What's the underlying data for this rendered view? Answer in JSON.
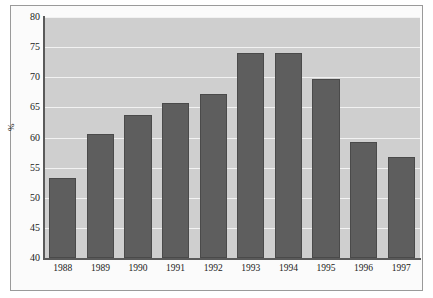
{
  "chart_data": {
    "type": "bar",
    "title": "",
    "subtitle": "",
    "xlabel": "",
    "ylabel": "%",
    "categories": [
      "1988",
      "1989",
      "1990",
      "1991",
      "1992",
      "1993",
      "1994",
      "1995",
      "1996",
      "1997"
    ],
    "values": [
      53.2,
      60.6,
      63.8,
      65.8,
      67.2,
      74.0,
      74.0,
      69.7,
      59.2,
      56.8
    ],
    "ylim": [
      40,
      80
    ],
    "yticks": [
      40,
      45,
      50,
      55,
      60,
      65,
      70,
      75,
      80
    ],
    "ytick_labels": [
      "40",
      "45",
      "50",
      "55",
      "60",
      "65",
      "70",
      "75",
      "80"
    ],
    "grid": true,
    "grid_axis": "y",
    "legend": false,
    "legend_position": "none",
    "bar_color": "#5e5e5e",
    "bar_edge_color": "#4a4a4a",
    "plot_background": "#cfcfcf",
    "gridline_color": "#f2f2f2",
    "figure_background": "#fbfbfb",
    "axis_color": "#5a5a5a"
  }
}
